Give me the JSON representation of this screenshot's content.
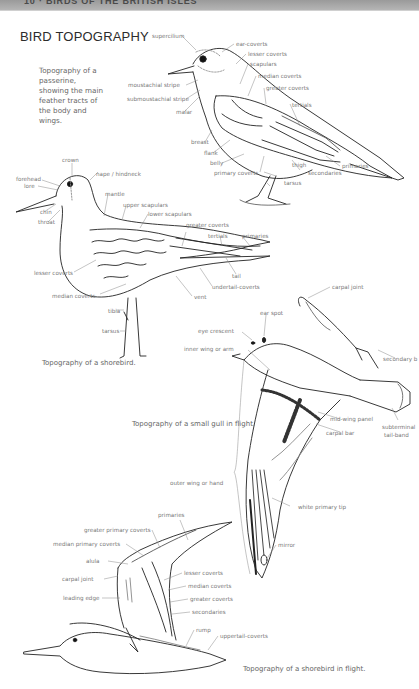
{
  "page": {
    "running_header": "10 · BIRDS OF THE BRITISH ISLES",
    "title": "BIRD TOPOGRAPHY"
  },
  "passerine": {
    "intro": "Topography of a passerine, showing the main feather tracts of the body and wings.",
    "labels": {
      "supercilium": "supercilium",
      "ear_coverts": "ear-coverts",
      "lesser_coverts": "lesser coverts",
      "scapulars": "scapulars",
      "median_coverts": "median coverts",
      "greater_coverts": "greater coverts",
      "tertials": "tertials",
      "moustachial_stripe": "moustachial stripe",
      "submoustachial_stripe": "submoustachial stripe",
      "malar": "malar",
      "breast": "breast",
      "flank": "flank",
      "belly": "belly",
      "primary_coverts": "primary coverts",
      "thigh": "thigh",
      "tarsus": "tarsus",
      "secondaries": "secondaries",
      "primaries": "primaries"
    }
  },
  "shorebird": {
    "caption": "Topography of a shorebird.",
    "labels": {
      "crown": "crown",
      "forehead": "forehead",
      "lore": "lore",
      "chin": "chin",
      "throat": "throat",
      "nape": "nape / hindneck",
      "mantle": "mantle",
      "upper_scapulars": "upper scapulars",
      "lower_scapulars": "lower scapulars",
      "greater_coverts": "greater coverts",
      "tertials": "tertials",
      "primaries": "primaries",
      "tail": "tail",
      "undertail_coverts": "undertail-coverts",
      "vent": "vent",
      "lesser_coverts": "lesser coverts",
      "median_coverts": "median coverts",
      "tibia": "tibia",
      "tarsus": "tarsus"
    }
  },
  "gull": {
    "caption": "Topography of a small gull in flight.",
    "labels": {
      "carpal_joint": "carpal joint",
      "ear_spot": "ear spot",
      "eye_crescent": "eye crescent",
      "inner_wing": "inner wing or arm",
      "secondary_bar": "secondary b",
      "mid_wing_panel": "mid-wing panel",
      "carpal_bar": "carpal bar",
      "subterminal_tail_band_1": "subterminal",
      "subterminal_tail_band_2": "tail-band",
      "outer_wing": "outer wing or hand",
      "white_primary_tip": "white primary tip",
      "mirror": "mirror"
    }
  },
  "shorebird_flight": {
    "caption": "Topography of a shorebird in flight.",
    "labels": {
      "primaries": "primaries",
      "greater_primary_coverts": "greater primary coverts",
      "median_primary_coverts": "median primary coverts",
      "alula": "alula",
      "carpal_joint": "carpal joint",
      "leading_edge": "leading edge",
      "lesser_coverts": "lesser coverts",
      "median_coverts": "median coverts",
      "greater_coverts": "greater coverts",
      "secondaries": "secondaries",
      "rump": "rump",
      "uppertail_coverts": "uppertail-coverts"
    }
  }
}
